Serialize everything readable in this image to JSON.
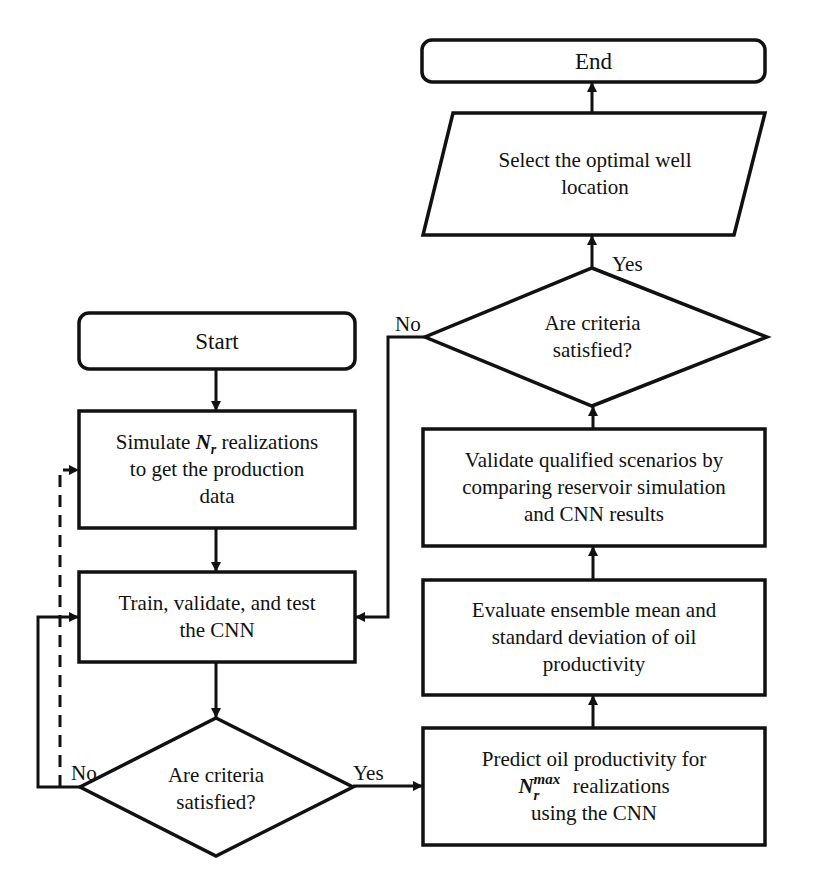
{
  "diagram": {
    "type": "flowchart",
    "nodes": {
      "start": {
        "label": "Start",
        "shape": "terminator"
      },
      "simulate": {
        "line1_pre": "Simulate ",
        "line1_var": "N",
        "line1_sub": "r",
        "line1_post": " realizations",
        "line2": "to get the production",
        "line3": "data",
        "shape": "process"
      },
      "train": {
        "line1": "Train, validate, and test",
        "line2": "the CNN",
        "shape": "process"
      },
      "decision1": {
        "line1": "Are criteria",
        "line2": "satisfied?",
        "shape": "decision"
      },
      "predict": {
        "line1": "Predict oil productivity for",
        "line2_var": "N",
        "line2_sub": "r",
        "line2_sup": "max",
        "line2_post": " realizations",
        "line3": "using the CNN",
        "shape": "process"
      },
      "evaluate": {
        "line1": "Evaluate ensemble mean and",
        "line2": "standard deviation of oil",
        "line3": "productivity",
        "shape": "process"
      },
      "validate": {
        "line1": "Validate qualified scenarios by",
        "line2": "comparing reservoir simulation",
        "line3": "and CNN results",
        "shape": "process"
      },
      "decision2": {
        "line1": "Are criteria",
        "line2": "satisfied?",
        "shape": "decision"
      },
      "select": {
        "line1": "Select the optimal well",
        "line2": "location",
        "shape": "io"
      },
      "end": {
        "label": "End",
        "shape": "terminator"
      }
    },
    "edge_labels": {
      "d1_no": "No",
      "d1_yes": "Yes",
      "d2_no": "No",
      "d2_yes": "Yes"
    },
    "edges": [
      {
        "from": "start",
        "to": "simulate",
        "style": "solid"
      },
      {
        "from": "simulate",
        "to": "train",
        "style": "solid"
      },
      {
        "from": "train",
        "to": "decision1",
        "style": "solid"
      },
      {
        "from": "decision1",
        "to": "train",
        "label": "No",
        "style": "solid"
      },
      {
        "from": "decision1",
        "to": "simulate",
        "label": "No",
        "style": "dashed"
      },
      {
        "from": "decision1",
        "to": "predict",
        "label": "Yes",
        "style": "solid"
      },
      {
        "from": "predict",
        "to": "evaluate",
        "style": "solid"
      },
      {
        "from": "evaluate",
        "to": "validate",
        "style": "solid"
      },
      {
        "from": "validate",
        "to": "decision2",
        "style": "solid"
      },
      {
        "from": "decision2",
        "to": "train",
        "label": "No",
        "style": "solid"
      },
      {
        "from": "decision2",
        "to": "select",
        "label": "Yes",
        "style": "solid"
      },
      {
        "from": "select",
        "to": "end",
        "style": "solid"
      }
    ],
    "colors": {
      "stroke": "#111111",
      "background": "#ffffff"
    }
  }
}
